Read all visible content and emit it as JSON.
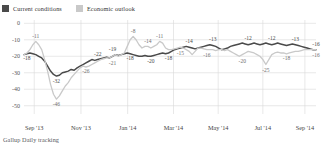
{
  "legend": {
    "items": [
      {
        "label": "Current conditions",
        "color": "#4a4a4a",
        "icon": "square-swatch-icon"
      },
      {
        "label": "Economic outlook",
        "color": "#c9c9c9",
        "icon": "square-swatch-icon"
      }
    ]
  },
  "source": {
    "text": "Gallup Daily tracking"
  },
  "chart_data": {
    "type": "line",
    "title": "",
    "subtitle": "",
    "xlabel": "",
    "ylabel": "",
    "ylim": [
      -55,
      2
    ],
    "yticks": [
      0,
      -10,
      -20,
      -30,
      -40,
      -50
    ],
    "ytick_labels": [
      "0",
      "-10",
      "-20",
      "-30",
      "-40",
      "-50"
    ],
    "xticks": [
      "Sep '13",
      "Nov '13",
      "Jan '14",
      "Mar '14",
      "May '14",
      "Jul '14",
      "Sep '14"
    ],
    "xtick_positions": [
      0.035,
      0.195,
      0.355,
      0.512,
      0.665,
      0.818,
      0.962
    ],
    "grid": true,
    "grid_axis": "both",
    "legend_position": "top-left",
    "series": [
      {
        "name": "Current conditions",
        "color": "#4a4a4a",
        "values": [
          -19,
          -18.5,
          -18,
          -18.5,
          -19,
          -20,
          -21,
          -23,
          -26,
          -29,
          -31,
          -32,
          -31.5,
          -30,
          -29.5,
          -29,
          -28,
          -28.5,
          -27,
          -26,
          -25,
          -24,
          -23,
          -22,
          -22.5,
          -22,
          -21.5,
          -21,
          -20.5,
          -21,
          -20,
          -19,
          -19.5,
          -19,
          -18.5,
          -18,
          -18.5,
          -19,
          -19.5,
          -20,
          -20,
          -19.5,
          -20,
          -20,
          -19.5,
          -19,
          -18.5,
          -18,
          -18.5,
          -18,
          -17,
          -16,
          -15.5,
          -15,
          -14.5,
          -14,
          -14.5,
          -15,
          -15.5,
          -15,
          -14.5,
          -14,
          -13.5,
          -13,
          -13.5,
          -14,
          -15,
          -16,
          -15.5,
          -15,
          -14,
          -13.5,
          -13,
          -12.5,
          -12,
          -12.5,
          -13,
          -12.5,
          -12,
          -12.5,
          -13,
          -12.5,
          -12,
          -12.5,
          -13,
          -12.5,
          -12,
          -12.5,
          -13,
          -13.5,
          -13,
          -12.5,
          -13,
          -13.5,
          -14,
          -14.5,
          -15,
          -15.5,
          -16,
          -16
        ],
        "labeled_points": [
          {
            "index": 1,
            "value": -18,
            "text": "-18",
            "pos": "below"
          },
          {
            "index": 11,
            "value": -32,
            "text": "-32",
            "pos": "below"
          },
          {
            "index": 25,
            "value": -22,
            "text": "-22",
            "pos": "above"
          },
          {
            "index": 30,
            "value": -19,
            "text": "-19",
            "pos": "above"
          },
          {
            "index": 36,
            "value": -18,
            "text": "-18",
            "pos": "below"
          },
          {
            "index": 43,
            "value": -20,
            "text": "-20",
            "pos": "below"
          },
          {
            "index": 49,
            "value": -18,
            "text": "-18",
            "pos": "below"
          },
          {
            "index": 56,
            "value": -14,
            "text": "-14",
            "pos": "above"
          },
          {
            "index": 64,
            "value": -13,
            "text": "-13",
            "pos": "above"
          },
          {
            "index": 76,
            "value": -12,
            "text": "-12",
            "pos": "above"
          },
          {
            "index": 84,
            "value": -12,
            "text": "-12",
            "pos": "above"
          },
          {
            "index": 92,
            "value": -13,
            "text": "-13",
            "pos": "above"
          },
          {
            "index": 99,
            "value": -16,
            "text": "-16",
            "pos": "above"
          }
        ]
      },
      {
        "name": "Economic outlook",
        "color": "#c9c9c9",
        "values": [
          -19,
          -18,
          -16,
          -13,
          -11,
          -13,
          -16,
          -22,
          -29,
          -37,
          -43,
          -46,
          -44,
          -41,
          -38,
          -36,
          -33,
          -31,
          -29,
          -27,
          -26,
          -26.5,
          -26,
          -25,
          -24,
          -23,
          -22,
          -21.5,
          -21,
          -21,
          -20,
          -19,
          -20,
          -19,
          -18,
          -14,
          -10,
          -8,
          -10,
          -13,
          -15,
          -14,
          -14,
          -15,
          -14,
          -13,
          -11,
          -12,
          -15,
          -16,
          -16,
          -15.5,
          -15,
          -14.5,
          -15,
          -16,
          -17,
          -19,
          -17,
          -15,
          -15,
          -15.5,
          -16,
          -16,
          -16,
          -16.5,
          -16,
          -16,
          -16.5,
          -16,
          -17,
          -18,
          -19,
          -20,
          -19,
          -18,
          -17,
          -17.5,
          -18,
          -19,
          -20,
          -22,
          -25,
          -22,
          -19,
          -18,
          -17.5,
          -18,
          -18,
          -18.5,
          -18,
          -17.5,
          -17,
          -17,
          -16.5,
          -16,
          -16,
          -16,
          -16,
          -16
        ],
        "labeled_points": [
          {
            "index": 4,
            "value": -11,
            "text": "-11",
            "pos": "above"
          },
          {
            "index": 11,
            "value": -46,
            "text": "-46",
            "pos": "below"
          },
          {
            "index": 21,
            "value": -26,
            "text": "-26",
            "pos": "below"
          },
          {
            "index": 30,
            "value": -21,
            "text": "-21",
            "pos": "below"
          },
          {
            "index": 37,
            "value": -8,
            "text": "-8",
            "pos": "above"
          },
          {
            "index": 42,
            "value": -14,
            "text": "-14",
            "pos": "above"
          },
          {
            "index": 46,
            "value": -11,
            "text": "-11",
            "pos": "above"
          },
          {
            "index": 53,
            "value": -15,
            "text": "-15",
            "pos": "below"
          },
          {
            "index": 62,
            "value": -16,
            "text": "-16",
            "pos": "below"
          },
          {
            "index": 74,
            "value": -20,
            "text": "-20",
            "pos": "below"
          },
          {
            "index": 82,
            "value": -25,
            "text": "-25",
            "pos": "below"
          },
          {
            "index": 89,
            "value": -18,
            "text": "-18",
            "pos": "below"
          },
          {
            "index": 99,
            "value": -16,
            "text": "-16",
            "pos": "below"
          }
        ]
      }
    ]
  }
}
